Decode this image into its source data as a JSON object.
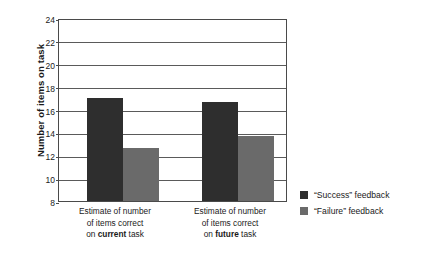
{
  "chart_data": {
    "type": "bar",
    "title": "",
    "xlabel": "",
    "ylabel": "Number of items on task",
    "ylim": [
      8,
      24
    ],
    "yticks": [
      8,
      10,
      12,
      14,
      16,
      18,
      20,
      22,
      24
    ],
    "grid": true,
    "legend_position": "right",
    "categories": [
      "Estimate of number of items correct on current task",
      "Estimate of number of items correct on future task"
    ],
    "category_lines": [
      [
        "Estimate of number",
        "of items correct",
        "on ",
        "current",
        " task"
      ],
      [
        "Estimate of number",
        "of items correct",
        "on ",
        "future",
        " task"
      ]
    ],
    "series": [
      {
        "name": "“Success” feedback",
        "color": "#2e2e2e",
        "values": [
          17.0,
          16.7
        ]
      },
      {
        "name": "“Failure” feedback",
        "color": "#6a6a6a",
        "values": [
          12.6,
          13.7
        ]
      }
    ]
  },
  "axis": {
    "y_title": "Number of items on task",
    "tick_labels": [
      "24",
      "22",
      "20",
      "18",
      "16",
      "14",
      "12",
      "10",
      "8"
    ]
  },
  "categories": [
    {
      "line1": "Estimate of number",
      "line2": "of items correct",
      "line3_prefix": "on ",
      "line3_bold": "current",
      "line3_suffix": " task"
    },
    {
      "line1": "Estimate of number",
      "line2": "of items correct",
      "line3_prefix": "on ",
      "line3_bold": "future",
      "line3_suffix": " task"
    }
  ],
  "legend": {
    "items": [
      {
        "label": "“Success” feedback",
        "color": "#2e2e2e"
      },
      {
        "label": "“Failure” feedback",
        "color": "#6a6a6a"
      }
    ]
  }
}
